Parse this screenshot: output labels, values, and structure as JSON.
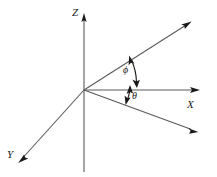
{
  "figure": {
    "background_color": "#ffffff",
    "line_color": "#5a5a5a",
    "accent_color": "#1a1a1a",
    "width": 217,
    "height": 177
  },
  "axes": [
    {
      "id": "z-axis",
      "label": "Z",
      "direction": "vertical-up",
      "origin": [
        84,
        90
      ],
      "tip": [
        84,
        14
      ],
      "tail": [
        84,
        172
      ],
      "arrowhead": true
    },
    {
      "id": "x-axis",
      "label": "X",
      "direction": "right",
      "origin": [
        84,
        90
      ],
      "tip": [
        199,
        90
      ],
      "arrowhead": true
    },
    {
      "id": "y-axis",
      "label": "Y",
      "direction": "lower-left",
      "origin": [
        84,
        90
      ],
      "tip": [
        19,
        162
      ],
      "arrowhead": true
    }
  ],
  "rays": [
    {
      "id": "upper-right-ray",
      "label": "",
      "origin": [
        84,
        90
      ],
      "tip": [
        191,
        22
      ],
      "arrowhead": true
    },
    {
      "id": "lower-right-ray",
      "label": "",
      "origin": [
        84,
        90
      ],
      "tip": [
        198,
        133
      ],
      "arrowhead": true
    }
  ],
  "angles": [
    {
      "id": "phi",
      "symbol": "ϕ",
      "label_position": [
        123,
        65
      ],
      "between": [
        "upper-right-ray",
        "x-axis"
      ],
      "double_headed": true
    },
    {
      "id": "theta",
      "symbol": "θ",
      "label_position": [
        132,
        91
      ],
      "between": [
        "x-axis",
        "lower-right-ray"
      ],
      "double_headed": true
    }
  ],
  "labels": {
    "z": "Z",
    "x": "X",
    "y": "Y",
    "phi": "ϕ",
    "theta": "θ"
  }
}
